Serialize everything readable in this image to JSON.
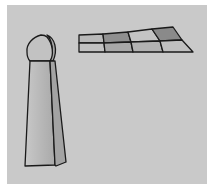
{
  "figure": {
    "background_color": "#c9c9c9",
    "outline_color": "#1a1a1a",
    "objects": [
      {
        "name": "game-piece",
        "type": "tall tapered pawn with dome top",
        "fill": "#b8b8b8",
        "side_fill": "#a5a5a5"
      },
      {
        "name": "board-grid",
        "type": "perspective 2x4 grid",
        "rows": 2,
        "cols": 4,
        "cell_colors": [
          [
            "#b9b9b9",
            "#8f8f8f",
            "#c4c4c4",
            "#8a8a8a"
          ],
          [
            "#c2c2c2",
            "#a8a8a8",
            "#b2b2b2",
            "#c0c0c0"
          ]
        ]
      }
    ]
  }
}
